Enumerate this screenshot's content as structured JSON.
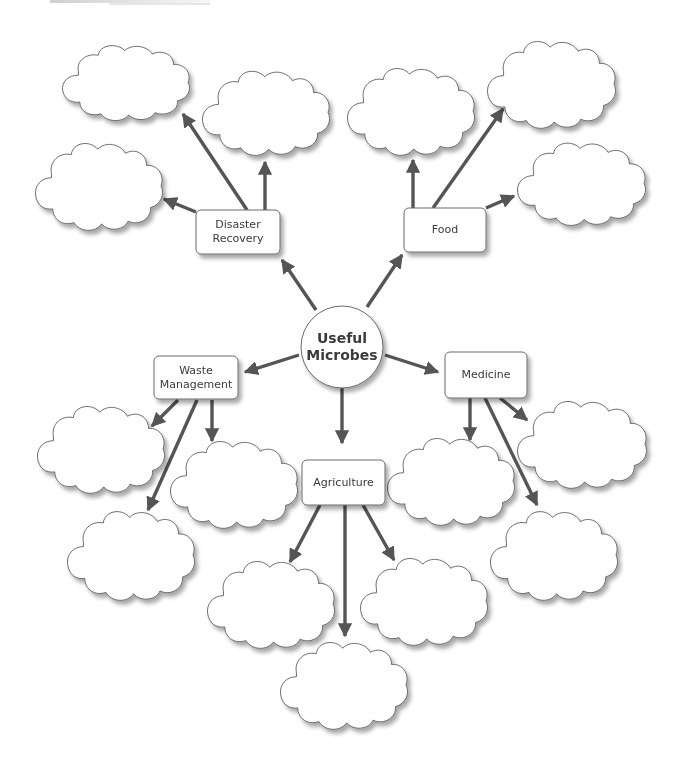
{
  "diagram": {
    "title_fragment": "",
    "center": {
      "label_line1": "Useful",
      "label_line2": "Microbes"
    },
    "colors": {
      "arrow": "#555555",
      "outline": "#6a6a6a",
      "box_fill": "#ffffff",
      "shadow": "#bdbdbd"
    },
    "branches": [
      {
        "id": "disaster-recovery",
        "label_line1": "Disaster",
        "label_line2": "Recovery",
        "blank_clouds": 3
      },
      {
        "id": "food",
        "label_line1": "Food",
        "label_line2": "",
        "blank_clouds": 3
      },
      {
        "id": "waste-management",
        "label_line1": "Waste",
        "label_line2": "Management",
        "blank_clouds": 3
      },
      {
        "id": "medicine",
        "label_line1": "Medicine",
        "label_line2": "",
        "blank_clouds": 3
      },
      {
        "id": "agriculture",
        "label_line1": "Agriculture",
        "label_line2": "",
        "blank_clouds": 3
      }
    ]
  }
}
